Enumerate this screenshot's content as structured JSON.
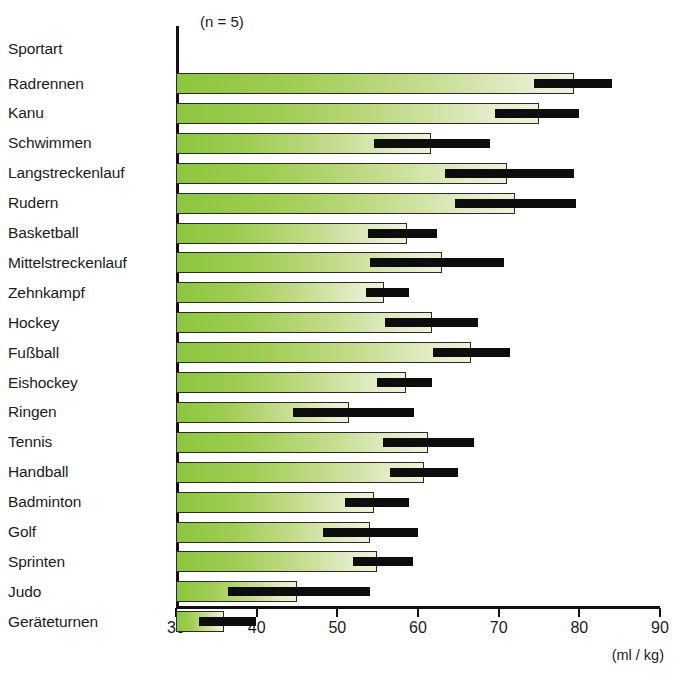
{
  "chart_data": {
    "type": "bar",
    "title": "",
    "subtitle": "",
    "xlabel": "(ml / kg)",
    "ylabel": "Sportart",
    "annotation": "(n = 5)",
    "xlim": [
      30,
      90
    ],
    "xticks": [
      30,
      40,
      50,
      60,
      70,
      80,
      90
    ],
    "xtick_labels": [
      "30",
      "40",
      "50",
      "60",
      "70",
      "80",
      "90"
    ],
    "grid": false,
    "legend": "none",
    "orientation": "horizontal",
    "value_label": "Mittelwert",
    "error_label": "Streubereich",
    "categories": [
      "Radrennen",
      "Kanu",
      "Schwimmen",
      "Langstreckenlauf",
      "Rudern",
      "Basketball",
      "Mittelstreckenlauf",
      "Zehnkampf",
      "Hockey",
      "Fußball",
      "Eishockey",
      "Ringen",
      "Tennis",
      "Handball",
      "Badminton",
      "Golf",
      "Sprinten",
      "Judo",
      "Geräteturnen"
    ],
    "values": [
      79.4,
      75.0,
      61.6,
      71.0,
      72.0,
      58.6,
      63.0,
      55.8,
      61.7,
      66.6,
      58.5,
      51.4,
      61.2,
      60.7,
      54.6,
      54.1,
      54.9,
      45.0,
      36.0
    ],
    "error_low": [
      74.4,
      69.5,
      54.5,
      63.4,
      64.6,
      53.8,
      54.0,
      53.5,
      55.9,
      61.9,
      54.9,
      44.5,
      55.6,
      56.5,
      51.0,
      48.2,
      51.9,
      36.5,
      32.9
    ],
    "error_high": [
      84.1,
      80.0,
      68.9,
      79.3,
      79.6,
      62.3,
      70.6,
      58.9,
      67.4,
      71.4,
      61.7,
      59.5,
      67.0,
      65.0,
      58.9,
      60.0,
      59.4,
      54.0,
      39.9
    ],
    "header_label": "Sportart",
    "colors": {
      "bar_start": "#8CC63E",
      "bar_end": "#EDF2DC",
      "bar_border": "#2a2a2a",
      "error_bar": "#0d0d0d",
      "axis": "#111111",
      "text": "#1b1b1b",
      "background": "#ffffff"
    }
  }
}
